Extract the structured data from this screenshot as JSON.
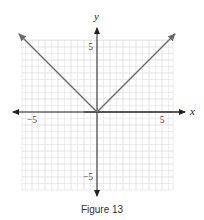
{
  "caption": "Figure 13",
  "chart_data": {
    "type": "line",
    "title": "Figure 13",
    "function": "y = |x|",
    "xlabel": "x",
    "ylabel": "y",
    "xlim": [
      -6,
      6
    ],
    "ylim": [
      -6,
      6
    ],
    "grid": true,
    "legend": null,
    "x_ticks": [
      -5,
      5
    ],
    "y_ticks": [
      5,
      -5
    ],
    "x_tick_labels": [
      "−5",
      "5"
    ],
    "y_tick_labels": [
      "5",
      "−5"
    ],
    "series": [
      {
        "name": "y = |x|",
        "x": [
          -6,
          -5,
          -4,
          -3,
          -2,
          -1,
          0,
          1,
          2,
          3,
          4,
          5,
          6
        ],
        "y": [
          6,
          5,
          4,
          3,
          2,
          1,
          0,
          1,
          2,
          3,
          4,
          5,
          6
        ],
        "arrows_both_ends": true
      }
    ]
  },
  "style": {
    "line_color": "#6b6b6b",
    "axis_color": "#222222",
    "grid_color": "#dcdcdc"
  }
}
